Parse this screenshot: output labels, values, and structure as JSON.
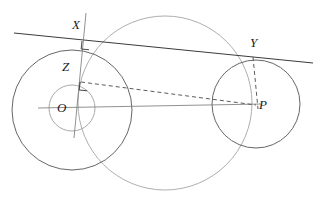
{
  "figure": {
    "width": 322,
    "height": 199,
    "background": "#ffffff"
  },
  "style": {
    "stroke_dark": "#3b3b3b",
    "stroke_mid": "#555555",
    "stroke_light": "#9a9a9a",
    "stroke_faint": "#b0b0b0",
    "label_color": "#1a1a1a",
    "stroke_width_main": 0.9,
    "stroke_width_light": 0.8
  },
  "labels": {
    "X": "X",
    "Y": "Y",
    "Z": "Z",
    "O": "O",
    "P": "P"
  },
  "points": {
    "O": {
      "x": 72,
      "y": 110,
      "label_x": 57,
      "label_y": 101
    },
    "P": {
      "x": 256,
      "y": 105,
      "label_x": 259,
      "label_y": 98
    },
    "X": {
      "x": 82,
      "y": 41,
      "label_x": 72,
      "label_y": 18
    },
    "Y": {
      "x": 253,
      "y": 57,
      "label_x": 250,
      "label_y": 36
    },
    "Z": {
      "x": 80,
      "y": 82,
      "label_x": 62,
      "label_y": 60
    }
  },
  "circles": [
    {
      "name": "small-circle-O",
      "cx": 72,
      "cy": 108,
      "r": 23,
      "stroke": "#9a9a9a"
    },
    {
      "name": "large-circle-O",
      "cx": 72,
      "cy": 110,
      "r": 60,
      "stroke": "#555555"
    },
    {
      "name": "circle-P",
      "cx": 256,
      "cy": 104,
      "r": 44,
      "stroke": "#555555"
    },
    {
      "name": "big-light-circle",
      "cx": 165,
      "cy": 103,
      "r": 87,
      "stroke": "#a5a5a5"
    }
  ],
  "lines": [
    {
      "name": "tangent-line-XY",
      "x1": 14,
      "y1": 33,
      "x2": 313,
      "y2": 63,
      "stroke": "#3b3b3b",
      "dashed": false
    },
    {
      "name": "line-OP",
      "x1": 38,
      "y1": 108,
      "x2": 262,
      "y2": 104,
      "stroke": "#777777",
      "dashed": false
    },
    {
      "name": "segment-XZ-extended",
      "x1": 86,
      "y1": 13,
      "x2": 74,
      "y2": 138,
      "stroke": "#777777",
      "dashed": false
    },
    {
      "name": "segment-ZP-dashed",
      "x1": 80,
      "y1": 82,
      "x2": 256,
      "y2": 105,
      "stroke": "#4a4a4a",
      "dashed": true
    },
    {
      "name": "segment-YP-dashed",
      "x1": 253,
      "y1": 57,
      "x2": 258,
      "y2": 108,
      "stroke": "#4a4a4a",
      "dashed": true
    }
  ],
  "right_angle_marks": [
    {
      "name": "right-angle-at-X",
      "x": 82,
      "y": 41,
      "size": 7,
      "rotate": 6
    },
    {
      "name": "right-angle-at-Z",
      "x": 80,
      "y": 82,
      "size": 7,
      "rotate": 6
    }
  ]
}
